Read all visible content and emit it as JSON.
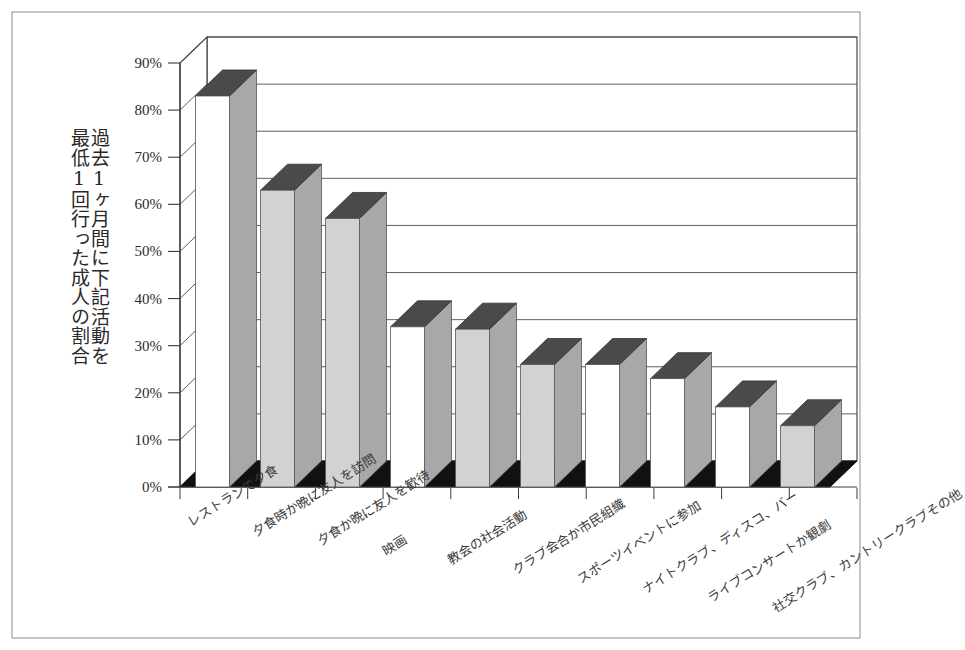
{
  "chart_data": {
    "type": "bar",
    "title": "",
    "ylabel_lines": [
      "過去1ヶ月間に下記活動を",
      "最低1回行った成人の割合"
    ],
    "xlabel": "",
    "ylim": [
      0,
      90
    ],
    "ytick_labels": [
      "0%",
      "10%",
      "20%",
      "30%",
      "40%",
      "50%",
      "60%",
      "70%",
      "80%",
      "90%"
    ],
    "ytick_values": [
      0,
      10,
      20,
      30,
      40,
      50,
      60,
      70,
      80,
      90
    ],
    "grid": true,
    "legend": "none",
    "style": "3d-column",
    "categories": [
      "レストランで夕食",
      "夕食時か晩に友人を訪問",
      "夕食か晩に友人を歓待",
      "映画",
      "教会の社会活動",
      "クラブ会合か市民組織",
      "スポーツイベントに参加",
      "ナイトクラブ、ディスコ、バー",
      "ライブコンサートか観劇",
      "社交クラブ、カントリークラブその他"
    ],
    "values": [
      83,
      63,
      57,
      34,
      33.5,
      26,
      26,
      23,
      17,
      13
    ],
    "bar_face_fills": [
      "white",
      "gray",
      "gray",
      "white",
      "gray",
      "gray",
      "white",
      "white",
      "white",
      "gray"
    ]
  },
  "colors": {
    "bar_face_white": "#ffffff",
    "bar_face_gray": "#d2d2d2",
    "bar_side": "#a8a8a8",
    "bar_top": "#4a4a4a",
    "floor": "#111111",
    "gridline": "#4d4d4d",
    "axis": "#3a3a3a",
    "frame": "#8c8c8c",
    "text": "#2a2a2a",
    "background": "#ffffff"
  }
}
